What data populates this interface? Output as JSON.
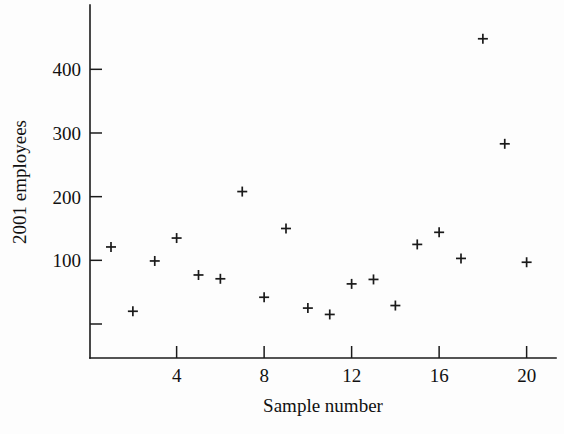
{
  "chart_data": {
    "type": "scatter",
    "title": "",
    "xlabel": "Sample number",
    "ylabel": "2001 employees",
    "xlim": [
      0,
      21.3
    ],
    "ylim": [
      -55,
      490
    ],
    "grid": false,
    "legend": null,
    "marker": "plus",
    "xticks": [
      4,
      8,
      12,
      16,
      20
    ],
    "xtick_labels": [
      "4",
      "8",
      "12",
      "16",
      "20"
    ],
    "yticks": [
      0,
      100,
      200,
      300,
      400
    ],
    "ytick_labels": [
      "",
      "100",
      "200",
      "300",
      "400"
    ],
    "x": [
      1,
      2,
      3,
      4,
      5,
      6,
      7,
      8,
      9,
      10,
      11,
      12,
      13,
      14,
      15,
      16,
      17,
      18,
      19,
      20
    ],
    "y": [
      121,
      20,
      99,
      135,
      77,
      71,
      208,
      42,
      150,
      25,
      15,
      63,
      70,
      29,
      125,
      144,
      103,
      448,
      283,
      97
    ],
    "points": [
      {
        "sample": 1,
        "employees": 121
      },
      {
        "sample": 2,
        "employees": 20
      },
      {
        "sample": 3,
        "employees": 99
      },
      {
        "sample": 4,
        "employees": 135
      },
      {
        "sample": 5,
        "employees": 77
      },
      {
        "sample": 6,
        "employees": 71
      },
      {
        "sample": 7,
        "employees": 208
      },
      {
        "sample": 8,
        "employees": 42
      },
      {
        "sample": 9,
        "employees": 150
      },
      {
        "sample": 10,
        "employees": 25
      },
      {
        "sample": 11,
        "employees": 15
      },
      {
        "sample": 12,
        "employees": 63
      },
      {
        "sample": 13,
        "employees": 70
      },
      {
        "sample": 14,
        "employees": 29
      },
      {
        "sample": 15,
        "employees": 125
      },
      {
        "sample": 16,
        "employees": 144
      },
      {
        "sample": 17,
        "employees": 103
      },
      {
        "sample": 18,
        "employees": 448
      },
      {
        "sample": 19,
        "employees": 283
      },
      {
        "sample": 20,
        "employees": 97
      }
    ],
    "colors": {
      "marker": "#1a1a1a",
      "axis": "#1b1b1b",
      "background": "#fdfdfd",
      "text": "#111111"
    }
  }
}
